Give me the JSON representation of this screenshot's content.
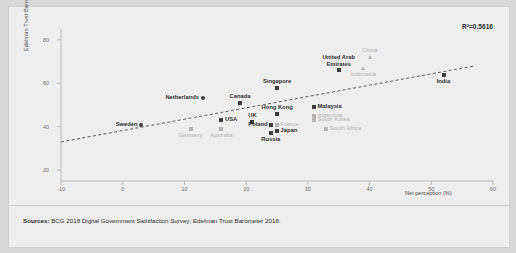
{
  "chart_data": {
    "type": "scatter",
    "title": "",
    "xlabel": "Net perception (%)",
    "ylabel": "Edelman Trust Barometer",
    "xlim": [
      -10,
      60
    ],
    "ylim": [
      15,
      85
    ],
    "xticks": [
      "-10",
      "0",
      "10",
      "20",
      "30",
      "40",
      "50",
      "60"
    ],
    "yticks": [
      "80",
      "60",
      "40",
      "20"
    ],
    "grid": false,
    "annotation": "R²=0.5616",
    "trendline": {
      "style": "dashed",
      "x0": -10,
      "y0": 33,
      "x1": 57,
      "y1": 68
    },
    "points": [
      {
        "label": "Sweden",
        "x": 3,
        "y": 41,
        "marker": "dot",
        "emphasis": "dark",
        "label_pos": "left"
      },
      {
        "label": "Germany",
        "x": 11,
        "y": 39,
        "marker": "sq",
        "emphasis": "light",
        "label_pos": "below"
      },
      {
        "label": "USA",
        "x": 16,
        "y": 43,
        "marker": "tri",
        "emphasis": "dark",
        "label_pos": "right"
      },
      {
        "label": "Australia",
        "x": 16,
        "y": 39,
        "marker": "sq",
        "emphasis": "light",
        "label_pos": "below"
      },
      {
        "label": "Netherlands",
        "x": 13,
        "y": 53,
        "marker": "dot",
        "emphasis": "dark",
        "label_pos": "left"
      },
      {
        "label": "Canada",
        "x": 19,
        "y": 51,
        "marker": "tri",
        "emphasis": "dark",
        "label_pos": "above"
      },
      {
        "label": "UK",
        "x": 21,
        "y": 42,
        "marker": "sq",
        "emphasis": "dark",
        "label_pos": "above"
      },
      {
        "label": "Poland",
        "x": 24,
        "y": 41,
        "marker": "sq",
        "emphasis": "dark",
        "label_pos": "left"
      },
      {
        "label": "France",
        "x": 25,
        "y": 41,
        "marker": "sq",
        "emphasis": "light",
        "label_pos": "right"
      },
      {
        "label": "Japan",
        "x": 25,
        "y": 38,
        "marker": "sq",
        "emphasis": "dark",
        "label_pos": "right"
      },
      {
        "label": "Russia",
        "x": 24,
        "y": 37,
        "marker": "sq",
        "emphasis": "dark",
        "label_pos": "below"
      },
      {
        "label": "Singapore",
        "x": 25,
        "y": 58,
        "marker": "tri",
        "emphasis": "dark",
        "label_pos": "above"
      },
      {
        "label": "Hong Kong",
        "x": 25,
        "y": 46,
        "marker": "tri",
        "emphasis": "dark",
        "label_pos": "above"
      },
      {
        "label": "Malaysia",
        "x": 31,
        "y": 49,
        "marker": "sq",
        "emphasis": "dark",
        "label_pos": "right"
      },
      {
        "label": "Argentina",
        "x": 31,
        "y": 45,
        "marker": "sq",
        "emphasis": "light",
        "label_pos": "right"
      },
      {
        "label": "South Korea",
        "x": 31,
        "y": 43,
        "marker": "sq",
        "emphasis": "light",
        "label_pos": "right"
      },
      {
        "label": "South Africa",
        "x": 33,
        "y": 39,
        "marker": "sq",
        "emphasis": "light",
        "label_pos": "right"
      },
      {
        "label": "United Arab Emirates",
        "x": 35,
        "y": 66,
        "marker": "tri",
        "emphasis": "dark",
        "label_pos": "above"
      },
      {
        "label": "Indonesia",
        "x": 39,
        "y": 67,
        "marker": "tri",
        "emphasis": "light",
        "label_pos": "below"
      },
      {
        "label": "China",
        "x": 40,
        "y": 72,
        "marker": "tri",
        "emphasis": "light",
        "label_pos": "above"
      },
      {
        "label": "India",
        "x": 52,
        "y": 64,
        "marker": "tri",
        "emphasis": "dark",
        "label_pos": "below"
      }
    ]
  },
  "footer": {
    "sources_label": "Sources:",
    "sources_text": " BCG 2018 Digital Government Satisfaction Survey; Edelman Trust Barometer 2018."
  }
}
